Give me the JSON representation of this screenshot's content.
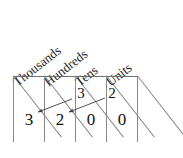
{
  "figure": {
    "type": "place-value-table",
    "headers": [
      {
        "label": "Thousands",
        "column": 1
      },
      {
        "label": "Hundreds",
        "column": 2
      },
      {
        "label": "Tens",
        "column": 3
      },
      {
        "label": "Units",
        "column": 4
      }
    ],
    "result_row": [
      {
        "value": "3",
        "column": 1
      },
      {
        "value": "2",
        "column": 2
      },
      {
        "value": "0",
        "column": 3
      },
      {
        "value": "0",
        "column": 4
      }
    ],
    "carry_row": [
      {
        "value": "3",
        "column": 3
      },
      {
        "value": "2",
        "column": 4
      }
    ],
    "arrows": [
      {
        "from_value": "3",
        "from_column": 3,
        "to_value": "3",
        "to_column": 1
      },
      {
        "from_value": "2",
        "from_column": 4,
        "to_value": "2",
        "to_column": 2
      }
    ],
    "colors": {
      "ink": "#111111",
      "rule": "#8a8a8a",
      "heavy_rule": "#6e6e6e",
      "background": "#ffffff"
    }
  }
}
